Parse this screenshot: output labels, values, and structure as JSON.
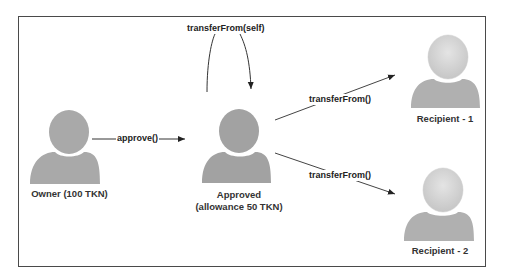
{
  "diagram": {
    "nodes": [
      {
        "id": "owner",
        "label": "Owner (100 TKN)",
        "color": "#a9a9a9"
      },
      {
        "id": "approved",
        "label_line1": "Approved",
        "label_line2": "(allowance 50 TKN)",
        "color": "#a2a2a2"
      },
      {
        "id": "recipient1",
        "label": "Recipient - 1",
        "color": "#c8c8c8"
      },
      {
        "id": "recipient2",
        "label": "Recipient - 2",
        "color": "#c8c8c8"
      }
    ],
    "edges": [
      {
        "from": "owner",
        "to": "approved",
        "label": "approve()"
      },
      {
        "from": "approved",
        "to": "approved",
        "label": "transferFrom(self)"
      },
      {
        "from": "approved",
        "to": "recipient1",
        "label": "transferFrom()"
      },
      {
        "from": "approved",
        "to": "recipient2",
        "label": "transferFrom()"
      }
    ]
  }
}
